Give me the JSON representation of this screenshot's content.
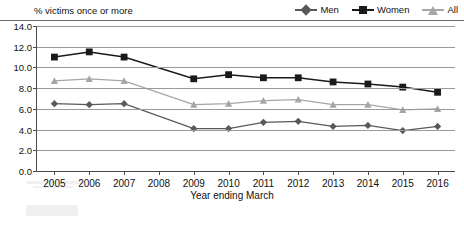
{
  "chart_data": {
    "type": "line",
    "title": "% victims once or more",
    "xlabel": "Year ending March",
    "ylabel": "",
    "ylim": [
      0.0,
      14.0
    ],
    "ytick_labels": [
      "0.0",
      "2.0",
      "4.0",
      "6.0",
      "8.0",
      "10.0",
      "12.0",
      "14.0"
    ],
    "ytick_values": [
      0.0,
      2.0,
      4.0,
      6.0,
      8.0,
      10.0,
      12.0,
      14.0
    ],
    "grid": true,
    "legend_position": "top-right",
    "categories": [
      "2005",
      "2006",
      "2007",
      "2008",
      "2009",
      "2010",
      "2011",
      "2012",
      "2013",
      "2014",
      "2015",
      "2016"
    ],
    "series": [
      {
        "name": "Men",
        "color": "#595959",
        "marker": "diamond",
        "values": [
          6.5,
          6.4,
          6.5,
          null,
          4.1,
          4.1,
          4.7,
          4.8,
          4.3,
          4.4,
          3.9,
          4.3
        ]
      },
      {
        "name": "Women",
        "color": "#1a1a1a",
        "marker": "square",
        "values": [
          11.0,
          11.5,
          11.0,
          null,
          8.9,
          9.3,
          9.0,
          9.0,
          8.6,
          8.4,
          8.1,
          7.6
        ]
      },
      {
        "name": "All",
        "color": "#a6a6a6",
        "marker": "triangle",
        "values": [
          8.7,
          8.9,
          8.7,
          null,
          6.4,
          6.5,
          6.8,
          6.9,
          6.4,
          6.4,
          5.9,
          6.0
        ]
      }
    ]
  },
  "footer": {
    "source_note": ""
  }
}
